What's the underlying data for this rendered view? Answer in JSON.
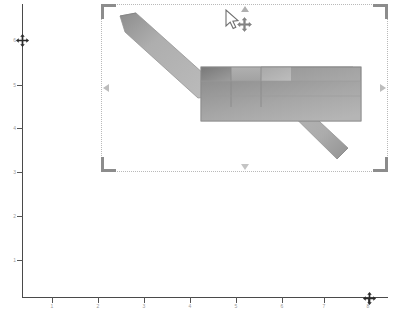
{
  "canvas": {
    "width": 396,
    "height": 312,
    "background_color": "#ffffff"
  },
  "plot": {
    "axis_color": "#4a4a4a",
    "tick_label_color": "#9a9a9a",
    "y_axis": {
      "name": "y-axis",
      "ticks": [
        {
          "label": "6",
          "y": 40
        },
        {
          "label": "5",
          "y": 85
        },
        {
          "label": "4",
          "y": 128
        },
        {
          "label": "3",
          "y": 172
        },
        {
          "label": "2",
          "y": 216
        },
        {
          "label": "1",
          "y": 260
        }
      ]
    },
    "x_axis": {
      "name": "x-axis",
      "ticks": [
        {
          "label": "1",
          "x": 52
        },
        {
          "label": "2",
          "x": 98
        },
        {
          "label": "3",
          "x": 144
        },
        {
          "label": "4",
          "x": 190
        },
        {
          "label": "5",
          "x": 236
        },
        {
          "label": "6",
          "x": 282
        },
        {
          "label": "7",
          "x": 324
        },
        {
          "label": "8",
          "x": 368
        }
      ]
    },
    "markers": [
      {
        "name": "y-axis-move-marker",
        "icon": "move-four-way-arrow-icon"
      },
      {
        "name": "x-axis-move-marker",
        "icon": "move-four-way-arrow-icon"
      }
    ]
  },
  "chart_data": {
    "type": "line",
    "title": "",
    "xlabel": "",
    "ylabel": "",
    "xlim": [
      0,
      8
    ],
    "ylim": [
      0,
      6
    ],
    "grid": false,
    "legend": null,
    "series": [
      {
        "name": "selected-shape-outline",
        "x": [
          1.0,
          2.6,
          4.9,
          7.6
        ],
        "y": [
          5.9,
          4.6,
          4.4,
          2.6
        ]
      }
    ],
    "annotations": [
      {
        "type": "selected-graphic",
        "shape": "bent-band-with-block",
        "bbox": {
          "x": 101,
          "y": 4,
          "width": 287,
          "height": 168
        }
      }
    ]
  },
  "selection": {
    "name": "selection-frame",
    "border_style": "dotted",
    "border_color": "#b9b9b9",
    "bbox": {
      "x": 101,
      "y": 4,
      "width": 287,
      "height": 168
    },
    "handles": [
      {
        "name": "handle-top-left",
        "type": "corner-bracket"
      },
      {
        "name": "handle-top-right",
        "type": "corner-bracket"
      },
      {
        "name": "handle-bottom-left",
        "type": "corner-bracket"
      },
      {
        "name": "handle-bottom-right",
        "type": "corner-bracket"
      },
      {
        "name": "handle-top-mid",
        "type": "triangle-up"
      },
      {
        "name": "handle-bottom-mid",
        "type": "triangle-down"
      },
      {
        "name": "handle-left-mid",
        "type": "triangle-left"
      },
      {
        "name": "handle-right-mid",
        "type": "triangle-right"
      }
    ]
  },
  "graphic": {
    "name": "selected-graphic-object",
    "fill_light": "#b8b8b8",
    "fill_mid": "#a0a0a0",
    "fill_dark": "#828282",
    "fill_darkest": "#6f6f6f",
    "stroke_color": "#8a8a8a",
    "parts": [
      {
        "name": "upper-left-diagonal-band"
      },
      {
        "name": "center-block"
      },
      {
        "name": "lower-right-diagonal-band"
      }
    ]
  },
  "cursor": {
    "name": "mouse-pointer",
    "icon": "arrow-pointer-with-move-icon",
    "x": 224,
    "y": 9,
    "color": "#7a7a7a"
  }
}
